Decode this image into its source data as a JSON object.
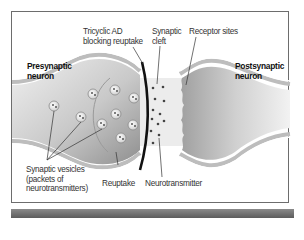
{
  "diagram": {
    "title_labels": {
      "presynaptic": [
        "Presynaptic",
        "neuron"
      ],
      "postsynaptic": [
        "Postsynaptic",
        "neuron"
      ]
    },
    "labels": {
      "tricyclic": [
        "Tricyclic AD",
        "blocking reuptake"
      ],
      "cleft": [
        "Synaptic",
        "cleft"
      ],
      "receptor": "Receptor sites",
      "vesicles": [
        "Synaptic vesicles",
        "(packets of",
        "neurotransmitters)"
      ],
      "reuptake": "Reuptake",
      "neurotransmitter": "Neurotransmitter"
    },
    "colors": {
      "neuron_fill_light": "#e4e4e4",
      "neuron_fill_dark": "#a9a9a9",
      "membrane": "#bdbdbd",
      "cleft_band": "#ececec",
      "blocker": "#111111",
      "frame": "#6d6d6d"
    }
  }
}
